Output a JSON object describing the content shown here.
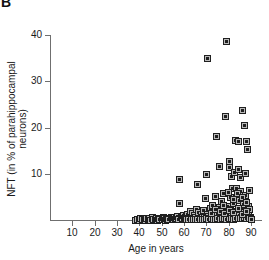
{
  "panel": {
    "label": "B"
  },
  "chart_data": {
    "type": "scatter",
    "title": "",
    "xlabel": "Age in years",
    "ylabel": "NFT (in % of parahippocampal\nneurons)",
    "xlim": [
      0,
      95
    ],
    "ylim": [
      0,
      40
    ],
    "xticks": [
      10,
      20,
      30,
      40,
      50,
      60,
      70,
      80,
      90
    ],
    "yticks": [
      10,
      20,
      30,
      40
    ],
    "xticklabels": [
      "10",
      "20",
      "30",
      "40",
      "50",
      "60",
      "70",
      "80",
      "90"
    ],
    "yticklabels": [
      "10",
      "20",
      "30",
      "40"
    ],
    "grid": false,
    "legend": null,
    "marker": "square-with-dot",
    "marker_face_color": "#b9b9b9",
    "marker_edge_color": "#1f1f1f",
    "axis_color": "#6f6f6f",
    "points": [
      [
        38.0,
        0.1
      ],
      [
        39.0,
        0.2
      ],
      [
        40.0,
        0.1
      ],
      [
        40.5,
        0.4
      ],
      [
        41.0,
        0.2
      ],
      [
        42.0,
        0.3
      ],
      [
        42.5,
        0.1
      ],
      [
        43.0,
        0.5
      ],
      [
        44.0,
        0.2
      ],
      [
        44.5,
        0.4
      ],
      [
        45.0,
        0.1
      ],
      [
        45.5,
        0.6
      ],
      [
        46.0,
        0.3
      ],
      [
        47.0,
        0.2
      ],
      [
        47.5,
        0.5
      ],
      [
        48.0,
        0.1
      ],
      [
        48.5,
        0.4
      ],
      [
        49.0,
        0.3
      ],
      [
        50.0,
        0.2
      ],
      [
        50.5,
        0.6
      ],
      [
        51.0,
        0.4
      ],
      [
        51.5,
        0.1
      ],
      [
        52.0,
        0.5
      ],
      [
        52.5,
        0.3
      ],
      [
        53.0,
        0.2
      ],
      [
        54.0,
        0.6
      ],
      [
        54.5,
        0.4
      ],
      [
        55.0,
        0.3
      ],
      [
        55.5,
        0.7
      ],
      [
        56.0,
        0.2
      ],
      [
        56.5,
        0.5
      ],
      [
        57.0,
        0.9
      ],
      [
        57.5,
        0.3
      ],
      [
        57.8,
        3.6
      ],
      [
        58.0,
        8.9
      ],
      [
        58.5,
        0.6
      ],
      [
        59.0,
        0.4
      ],
      [
        59.5,
        1.0
      ],
      [
        60.0,
        0.5
      ],
      [
        60.5,
        0.3
      ],
      [
        61.0,
        0.8
      ],
      [
        61.5,
        1.3
      ],
      [
        62.0,
        0.4
      ],
      [
        62.5,
        2.0
      ],
      [
        63.0,
        0.7
      ],
      [
        63.5,
        1.5
      ],
      [
        64.0,
        0.5
      ],
      [
        64.5,
        1.1
      ],
      [
        65.0,
        0.6
      ],
      [
        65.5,
        2.4
      ],
      [
        66.0,
        7.8
      ],
      [
        66.2,
        0.9
      ],
      [
        66.5,
        1.8
      ],
      [
        67.0,
        0.5
      ],
      [
        67.5,
        1.2
      ],
      [
        68.0,
        0.7
      ],
      [
        68.5,
        2.1
      ],
      [
        69.0,
        0.6
      ],
      [
        69.5,
        4.7
      ],
      [
        70.0,
        9.9
      ],
      [
        70.2,
        35.0
      ],
      [
        70.5,
        1.4
      ],
      [
        71.0,
        0.8
      ],
      [
        71.5,
        2.6
      ],
      [
        72.0,
        1.0
      ],
      [
        72.5,
        3.3
      ],
      [
        73.0,
        0.7
      ],
      [
        73.5,
        1.9
      ],
      [
        74.0,
        5.3
      ],
      [
        74.3,
        0.6
      ],
      [
        74.5,
        18.2
      ],
      [
        75.0,
        1.5
      ],
      [
        75.5,
        11.6
      ],
      [
        75.8,
        2.8
      ],
      [
        76.0,
        0.9
      ],
      [
        76.5,
        4.1
      ],
      [
        77.0,
        1.3
      ],
      [
        77.5,
        5.8
      ],
      [
        78.0,
        2.2
      ],
      [
        78.3,
        22.6
      ],
      [
        78.5,
        0.8
      ],
      [
        79.0,
        38.7
      ],
      [
        79.2,
        3.0
      ],
      [
        79.5,
        1.6
      ],
      [
        80.0,
        12.8
      ],
      [
        80.2,
        11.4
      ],
      [
        80.5,
        5.0
      ],
      [
        80.8,
        2.4
      ],
      [
        81.0,
        9.6
      ],
      [
        81.3,
        0.9
      ],
      [
        81.5,
        6.9
      ],
      [
        82.0,
        3.6
      ],
      [
        82.3,
        10.3
      ],
      [
        82.5,
        1.2
      ],
      [
        83.0,
        17.3
      ],
      [
        83.2,
        7.0
      ],
      [
        83.5,
        2.0
      ],
      [
        84.0,
        17.1
      ],
      [
        84.2,
        11.0
      ],
      [
        84.5,
        4.3
      ],
      [
        84.8,
        1.1
      ],
      [
        85.0,
        9.4
      ],
      [
        85.3,
        6.2
      ],
      [
        85.5,
        2.7
      ],
      [
        86.0,
        23.7
      ],
      [
        86.3,
        3.5
      ],
      [
        86.5,
        1.4
      ],
      [
        87.0,
        20.6
      ],
      [
        87.2,
        10.1
      ],
      [
        87.5,
        5.5
      ],
      [
        87.8,
        0.9
      ],
      [
        88.0,
        17.0
      ],
      [
        88.2,
        15.3
      ],
      [
        88.5,
        3.1
      ],
      [
        88.8,
        1.8
      ],
      [
        89.0,
        6.5
      ],
      [
        89.3,
        2.3
      ],
      [
        89.5,
        0.7
      ],
      [
        61.0,
        0.15
      ],
      [
        62.0,
        0.2
      ],
      [
        63.0,
        0.25
      ],
      [
        64.0,
        0.2
      ],
      [
        65.0,
        0.3
      ],
      [
        66.0,
        0.15
      ],
      [
        67.0,
        0.25
      ],
      [
        68.0,
        0.3
      ],
      [
        69.0,
        0.2
      ],
      [
        70.0,
        0.35
      ],
      [
        71.0,
        0.25
      ],
      [
        72.0,
        0.4
      ],
      [
        73.0,
        0.2
      ],
      [
        74.0,
        0.3
      ],
      [
        75.0,
        0.45
      ],
      [
        76.0,
        0.25
      ],
      [
        77.0,
        0.35
      ],
      [
        78.0,
        0.5
      ],
      [
        79.0,
        0.3
      ],
      [
        80.0,
        0.4
      ],
      [
        81.0,
        0.55
      ],
      [
        82.0,
        0.3
      ],
      [
        83.0,
        0.45
      ],
      [
        84.0,
        0.35
      ],
      [
        85.0,
        0.5
      ],
      [
        86.0,
        0.4
      ],
      [
        87.0,
        0.6
      ],
      [
        88.0,
        0.35
      ],
      [
        89.0,
        0.45
      ],
      [
        90.0,
        0.3
      ],
      [
        72.0,
        1.6
      ],
      [
        74.0,
        2.3
      ],
      [
        76.0,
        1.9
      ],
      [
        78.0,
        1.5
      ],
      [
        80.0,
        2.1
      ],
      [
        82.0,
        1.7
      ],
      [
        84.0,
        2.5
      ],
      [
        86.0,
        1.3
      ],
      [
        88.0,
        2.0
      ],
      [
        83.8,
        5.9
      ],
      [
        81.8,
        4.6
      ],
      [
        79.8,
        6.1
      ],
      [
        85.8,
        4.9
      ],
      [
        87.6,
        3.8
      ],
      [
        77.6,
        3.2
      ]
    ]
  }
}
